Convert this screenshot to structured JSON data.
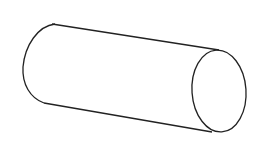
{
  "diagram": {
    "shape": "cylinder",
    "style": "line-drawing",
    "stroke_color": "#222222",
    "background_color": "#ffffff",
    "stroke_width": 1.3,
    "end_cap": {
      "cx": 219,
      "cy": 91,
      "rx": 27,
      "ry": 41
    },
    "top_edge": {
      "from": [
        52,
        24
      ],
      "to": [
        219,
        50
      ]
    },
    "bottom_edge": {
      "from": [
        44,
        103
      ],
      "to": [
        212,
        132
      ]
    },
    "left_cap_path": "M 55 24 C 38 26, 25 45, 23 67 C 22 84, 30 98, 44 103"
  }
}
